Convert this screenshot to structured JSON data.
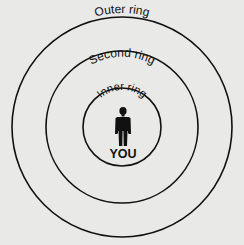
{
  "diagram": {
    "background_color": "#e9e9e7",
    "stroke_color": "#111111",
    "center": {
      "label": "YOU",
      "icon": "person-icon"
    },
    "rings": [
      {
        "id": "inner",
        "label": "Inner ring"
      },
      {
        "id": "second",
        "label": "Second ring"
      },
      {
        "id": "outer",
        "label": "Outer ring"
      }
    ]
  }
}
